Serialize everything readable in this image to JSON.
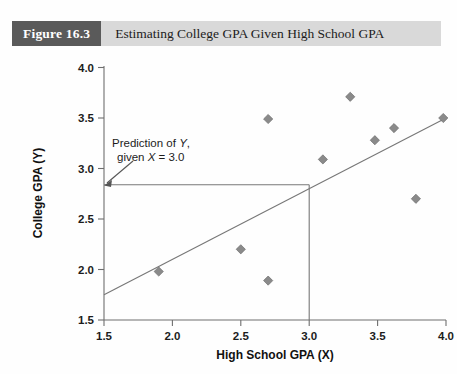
{
  "figure": {
    "tag": "Figure 16.3",
    "title": "Estimating College GPA Given High School GPA"
  },
  "chart_data": {
    "type": "scatter",
    "title": "Estimating College GPA Given High School GPA",
    "xlabel": "High School GPA (X)",
    "ylabel": "College GPA (Y)",
    "xlim": [
      1.5,
      4.0
    ],
    "ylim": [
      1.5,
      4.0
    ],
    "xticks": [
      "1.5",
      "2.0",
      "2.5",
      "3.0",
      "3.5",
      "4.0"
    ],
    "yticks": [
      "1.5",
      "2.0",
      "2.5",
      "3.0",
      "3.5",
      "4.0"
    ],
    "xtick_values": [
      1.5,
      2.0,
      2.5,
      3.0,
      3.5,
      4.0
    ],
    "ytick_values": [
      1.5,
      2.0,
      2.5,
      3.0,
      3.5,
      4.0
    ],
    "grid": false,
    "legend": null,
    "marker": "diamond",
    "marker_color": "#8a8a8a",
    "points": [
      {
        "x": 1.9,
        "y": 1.98
      },
      {
        "x": 2.5,
        "y": 2.2
      },
      {
        "x": 2.7,
        "y": 1.89
      },
      {
        "x": 2.7,
        "y": 3.49
      },
      {
        "x": 3.1,
        "y": 3.09
      },
      {
        "x": 3.3,
        "y": 3.71
      },
      {
        "x": 3.48,
        "y": 3.28
      },
      {
        "x": 3.62,
        "y": 3.4
      },
      {
        "x": 3.78,
        "y": 2.7
      },
      {
        "x": 3.98,
        "y": 3.5
      }
    ],
    "regression_line": {
      "x_start": 1.5,
      "y_start": 1.75,
      "x_end": 4.0,
      "y_end": 3.5,
      "color": "#777777"
    },
    "prediction": {
      "x_value": 3.0,
      "y_value": 2.85,
      "vertical_from_y": 1.5,
      "horizontal_to_x": 1.5,
      "color": "#777777"
    },
    "annotation": {
      "line1_prefix": "Prediction of ",
      "line1_em": "Y",
      "line1_suffix": ",",
      "line2_prefix": "given ",
      "line2_em": "X",
      "line2_suffix": " = 3.0"
    }
  }
}
